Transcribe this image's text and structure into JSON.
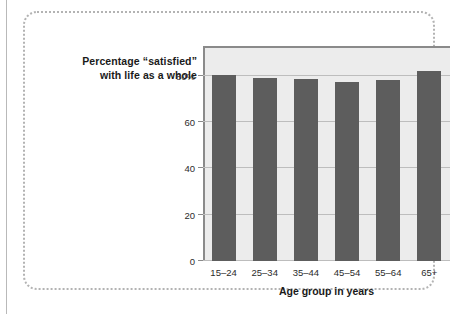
{
  "figure": {
    "title_lines": [
      "Percentage “satisfied”",
      "with life as a whole"
    ],
    "frame_style": "dotted"
  },
  "chart_data": {
    "type": "bar",
    "title": "Percentage “satisfied” with life as a whole",
    "categories": [
      "15–24",
      "25–34",
      "35–44",
      "45–54",
      "55–64",
      "65+"
    ],
    "values": [
      80.5,
      79.0,
      78.5,
      77.5,
      78.0,
      82.0
    ],
    "xlabel": "Age group in years",
    "ylabel": "Percentage “satisfied” with life as a whole",
    "ytick_labels": [
      "0",
      "20",
      "40",
      "60",
      "80%"
    ],
    "ytick_values": [
      0,
      20,
      40,
      60,
      80
    ],
    "ylim": [
      0,
      92
    ],
    "grid": true,
    "legend": null,
    "bar_color": "#5d5d5d",
    "plot_background": "#ececec",
    "gridline_color": "#bdbdbd",
    "axis_color": "#8a8a8a"
  }
}
